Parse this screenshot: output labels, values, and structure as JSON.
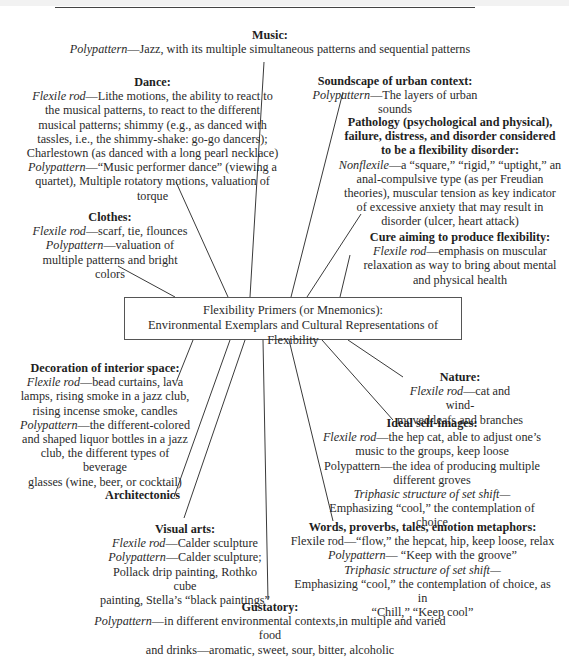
{
  "center": {
    "line1": "Flexibility Primers (or Mnemonics):",
    "line2": "Environmental Exemplars and Cultural Representations of Flexibility"
  },
  "nodes": {
    "music": {
      "title": "Music:",
      "lines": [
        {
          "label": "Polypattern",
          "text": "—Jazz, with its multiple simultaneous patterns and sequential patterns"
        }
      ]
    },
    "soundscape": {
      "title": "Soundscape of urban context:",
      "lines": [
        {
          "label": "Polypattern",
          "text": "—The layers of urban"
        },
        {
          "label": "",
          "text": "sounds"
        }
      ]
    },
    "dance": {
      "title": "Dance:",
      "lines": [
        {
          "label": "Flexile rod",
          "text": "—Lithe motions, the ability to react to"
        },
        {
          "label": "",
          "text": "the musical patterns, to react to the different"
        },
        {
          "label": "",
          "text": "musical patterns; shimmy (e.g., as danced with"
        },
        {
          "label": "",
          "text": "tassles, i.e., the shimmy-shake: go-go dancers);"
        },
        {
          "label": "",
          "text": "Charlestown (as danced with a long pearl necklace)"
        },
        {
          "label": "Polypattern",
          "text": "—“Music performer dance” (viewing a"
        },
        {
          "label": "",
          "text": "quartet), Multiple rotatory motions, valuation of"
        },
        {
          "label": "",
          "text": "torque"
        }
      ]
    },
    "pathology": {
      "title_lines": [
        "Pathology (psychological and physical),",
        "failure, distress, and disorder considered",
        "to be a flexibility disorder:"
      ],
      "lines": [
        {
          "label": "Nonflexile",
          "text": "—a “square,” “rigid,” “uptight,” an"
        },
        {
          "label": "",
          "text": "anal-compulsive type (as per Freudian"
        },
        {
          "label": "",
          "text": "theories), muscular tension as key indicator"
        },
        {
          "label": "",
          "text": "of excessive anxiety that may result in"
        },
        {
          "label": "",
          "text": "disorder (ulcer, heart attack)"
        }
      ]
    },
    "clothes": {
      "title": "Clothes:",
      "lines": [
        {
          "label": "Flexile rod",
          "text": "—scarf, tie, flounces"
        },
        {
          "label": "Polypattern",
          "text": "—valuation of"
        },
        {
          "label": "",
          "text": "multiple patterns and bright colors"
        }
      ]
    },
    "cure": {
      "title": "Cure aiming to produce flexibility:",
      "lines": [
        {
          "label": "Flexile rod",
          "text": "—emphasis on muscular"
        },
        {
          "label": "",
          "text": "relaxation as way to bring about mental"
        },
        {
          "label": "",
          "text": "and physical health"
        }
      ]
    },
    "decoration": {
      "title": "Decoration of interior space:",
      "lines": [
        {
          "label": "Flexile rod",
          "text": "—bead curtains, lava"
        },
        {
          "label": "",
          "text": "lamps, rising smoke in a jazz club,"
        },
        {
          "label": "",
          "text": "rising incense smoke, candles"
        },
        {
          "label": "Polypattern",
          "text": "—the different-colored"
        },
        {
          "label": "",
          "text": "and shaped liquor bottles in a jazz"
        },
        {
          "label": "",
          "text": "club, the different types of beverage"
        },
        {
          "label": "",
          "text": "glasses (wine, beer, or cocktail)"
        }
      ]
    },
    "nature": {
      "title": "Nature:",
      "lines": [
        {
          "label": "Flexile rod",
          "text": "—cat and wind-"
        },
        {
          "label": "",
          "text": "moved leafs and branches"
        }
      ]
    },
    "ideal_self": {
      "title": "Ideal self-images:",
      "lines": [
        {
          "label": "Flexile rod",
          "text": "—the hep cat, able to adjust one’s"
        },
        {
          "label": "",
          "text": "music to the groups, keep loose"
        },
        {
          "label": "",
          "text": "Polypattern—the idea of producing multiple"
        },
        {
          "label": "",
          "text": "different groves"
        },
        {
          "label": "Triphasic structure of set shift—",
          "text": ""
        },
        {
          "label": "",
          "text": "Emphasizing “cool,” the contemplation of"
        },
        {
          "label": "",
          "text": "choice"
        }
      ]
    },
    "architectonics": {
      "title": "Architectonics"
    },
    "visual_arts": {
      "title": "Visual arts:",
      "lines": [
        {
          "label": "Flexile rod",
          "text": "—Calder sculpture"
        },
        {
          "label": "Polypattern",
          "text": "—Calder sculpture;"
        },
        {
          "label": "",
          "text": "Pollack drip painting, Rothko cube"
        },
        {
          "label": "",
          "text": "painting, Stella’s “black paintings”"
        }
      ]
    },
    "words": {
      "title": "Words, proverbs, tales, emotion metaphors:",
      "lines": [
        {
          "label": "",
          "text": "Flexile rod—“flow,” the hepcat, hip, keep loose, relax"
        },
        {
          "label": "Polypattern",
          "text": "— “Keep with the groove”"
        },
        {
          "label": "Triphasic structure of set shift—",
          "text": ""
        },
        {
          "label": "",
          "text": "Emphasizing “cool,” the contemplation of choice, as in"
        },
        {
          "label": "",
          "text": "“Chill,” “Keep cool”"
        }
      ]
    },
    "gustatory": {
      "title": "Gustatory:",
      "lines": [
        {
          "label": "Polypattern",
          "text": "—in different environmental contexts,in multiple and varied food"
        },
        {
          "label": "",
          "text": "and drinks—aromatic, sweet, sour, bitter, alcoholic"
        }
      ]
    }
  }
}
